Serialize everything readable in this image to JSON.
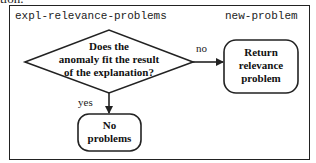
{
  "caption_fragment": "tion.",
  "frame": {
    "title_left": "expl-relevance-problems",
    "title_right": "new-problem"
  },
  "nodes": {
    "decision": {
      "shape": "diamond",
      "lines": [
        "Does the",
        "anomaly fit the result",
        "of the explanation?"
      ]
    },
    "return_box": {
      "shape": "rounded-rectangle",
      "lines": [
        "Return",
        "relevance",
        "problem"
      ]
    },
    "no_problems_box": {
      "shape": "rounded-rectangle",
      "lines": [
        "No",
        "problems"
      ]
    }
  },
  "edges": {
    "no_edge": {
      "from": "decision",
      "to": "return_box",
      "label": "no"
    },
    "yes_edge": {
      "from": "decision",
      "to": "no_problems_box",
      "label": "yes"
    }
  },
  "colors": {
    "stroke": "#222222",
    "background": "#ffffff"
  }
}
